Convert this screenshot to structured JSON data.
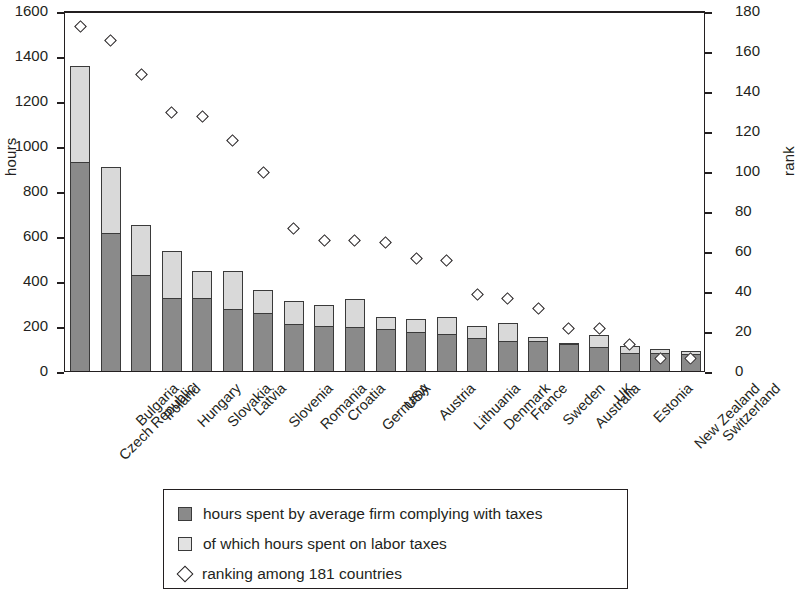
{
  "chart_data": {
    "type": "bar",
    "title": "",
    "xlabel": "",
    "ylabel": "hours",
    "y2label": "rank",
    "ylim": [
      0,
      1600
    ],
    "y2lim": [
      0,
      180
    ],
    "yticks": [
      0,
      200,
      400,
      600,
      800,
      1000,
      1200,
      1400,
      1600
    ],
    "y2ticks": [
      0,
      20,
      40,
      60,
      80,
      100,
      120,
      140,
      160,
      180
    ],
    "grid": false,
    "legend_position": "below-plot",
    "categories": [
      "Czech Republic",
      "Bulgaria",
      "Poland",
      "Hungary",
      "Slovakia",
      "Latvia",
      "Slovenia",
      "Romania",
      "Croatia",
      "Germany",
      "USA",
      "Austria",
      "Lithuania",
      "Denmark",
      "France",
      "Sweden",
      "Australia",
      "UK",
      "Estonia",
      "New Zealand",
      "Switzerland"
    ],
    "series": [
      {
        "name": "hours spent by average firm complying with taxes",
        "axis": "left",
        "type": "bar",
        "color": "#8a8a8a",
        "values": [
          930,
          615,
          425,
          325,
          325,
          275,
          260,
          210,
          200,
          195,
          185,
          175,
          165,
          145,
          135,
          135,
          120,
          105,
          80,
          80,
          75
        ]
      },
      {
        "name": "of which hours spent on labor taxes",
        "axis": "left",
        "type": "bar",
        "color": "#d9d9d9",
        "values": [
          425,
          290,
          225,
          210,
          120,
          170,
          100,
          100,
          95,
          125,
          55,
          55,
          75,
          55,
          80,
          15,
          5,
          55,
          30,
          20,
          15
        ]
      },
      {
        "name": "ranking among 181 countries",
        "axis": "right",
        "type": "scatter",
        "marker": "diamond",
        "values": [
          173,
          166,
          149,
          130,
          128,
          116,
          100,
          72,
          66,
          66,
          65,
          57,
          56,
          39,
          37,
          32,
          22,
          22,
          14,
          7,
          7
        ]
      }
    ],
    "totals": [
      1355,
      905,
      650,
      535,
      445,
      445,
      360,
      310,
      295,
      320,
      240,
      230,
      240,
      200,
      215,
      150,
      125,
      160,
      110,
      100,
      90
    ]
  },
  "axes": {
    "left_title": "hours",
    "right_title": "rank",
    "left_ticks": [
      "1600",
      "1400",
      "1200",
      "1000",
      "800",
      "600",
      "400",
      "200",
      "0"
    ],
    "right_ticks": [
      "180",
      "160",
      "140",
      "120",
      "100",
      "80",
      "60",
      "40",
      "20",
      "0"
    ]
  },
  "legend": {
    "items": [
      {
        "marker": "filled-square-dark",
        "label": "hours spent by average firm complying with taxes"
      },
      {
        "marker": "filled-square-light",
        "label": "of which hours spent on labor taxes"
      },
      {
        "marker": "open-diamond",
        "label": "ranking among 181 countries"
      }
    ]
  }
}
